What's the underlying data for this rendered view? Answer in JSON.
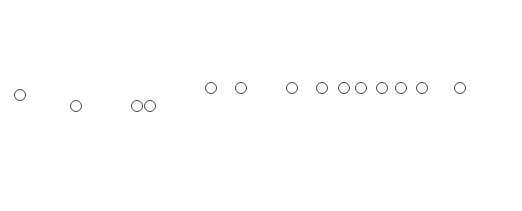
{
  "figure": {
    "panels": [
      {
        "id": "whole-worm",
        "description": "Whole earthworm external view"
      },
      {
        "id": "anterior-external",
        "description": "Anterior end external view"
      },
      {
        "id": "anterior-dissected",
        "description": "Anterior end internal dissection"
      }
    ],
    "labels_left": [
      {
        "text": "①",
        "x": 20,
        "y": 95
      },
      {
        "text": "②",
        "x": 76,
        "y": 106
      },
      {
        "text": "③",
        "x": 137,
        "y": 106
      },
      {
        "text": "④",
        "x": 150,
        "y": 106
      }
    ],
    "labels_right": [
      {
        "text": "①",
        "x": 211,
        "y": 88
      },
      {
        "text": "⑤",
        "x": 241,
        "y": 88
      },
      {
        "text": "⑥",
        "x": 292,
        "y": 88
      },
      {
        "text": "⑦",
        "x": 322,
        "y": 88
      },
      {
        "text": "④",
        "x": 344,
        "y": 88
      },
      {
        "text": "⑧",
        "x": 361,
        "y": 88
      },
      {
        "text": "⑨",
        "x": 382,
        "y": 88
      },
      {
        "text": "⑩",
        "x": 401,
        "y": 88
      },
      {
        "text": "⑪",
        "x": 422,
        "y": 88
      },
      {
        "text": "⑫",
        "x": 460,
        "y": 88
      }
    ],
    "colors": {
      "ink": "#3a3a3a",
      "paper": "#ffffff"
    }
  }
}
